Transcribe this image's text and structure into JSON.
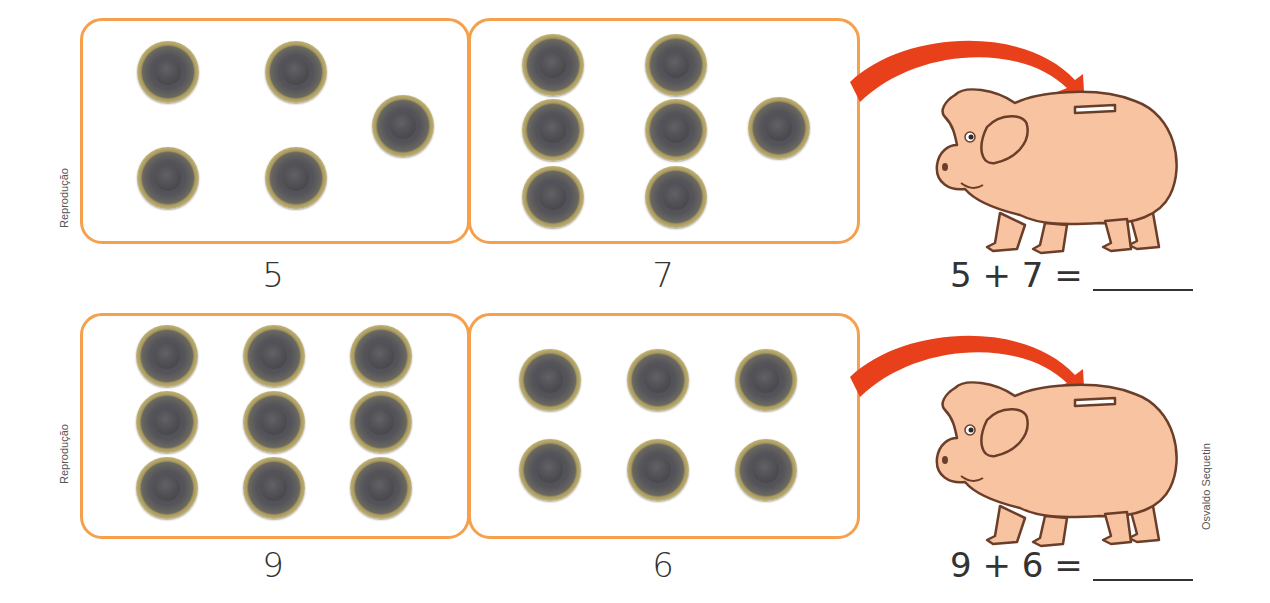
{
  "exercises": [
    {
      "left_count": 5,
      "right_count": 7,
      "left_label": "5",
      "right_label": "7",
      "equation": "5 + 7 =",
      "credit": "Reprodução",
      "left_coins": [
        [
          168,
          72
        ],
        [
          296,
          72
        ],
        [
          403,
          126
        ],
        [
          168,
          178
        ],
        [
          296,
          178
        ]
      ],
      "right_coins": [
        [
          553,
          65
        ],
        [
          676,
          65
        ],
        [
          779,
          128
        ],
        [
          553,
          130
        ],
        [
          676,
          130
        ],
        [
          553,
          197
        ],
        [
          676,
          197
        ]
      ]
    },
    {
      "left_count": 9,
      "right_count": 6,
      "left_label": "9",
      "right_label": "6",
      "equation": "9 + 6 =",
      "credit": "Reprodução",
      "left_coins": [
        [
          167,
          356
        ],
        [
          274,
          356
        ],
        [
          381,
          356
        ],
        [
          167,
          422
        ],
        [
          274,
          422
        ],
        [
          381,
          422
        ],
        [
          167,
          488
        ],
        [
          274,
          488
        ],
        [
          381,
          488
        ]
      ],
      "right_coins": [
        [
          550,
          380
        ],
        [
          658,
          380
        ],
        [
          766,
          380
        ],
        [
          550,
          470
        ],
        [
          658,
          470
        ],
        [
          766,
          470
        ]
      ]
    }
  ],
  "illustrator_credit": "Osvaldo Sequetin",
  "colors": {
    "box_border": "#f6a04d",
    "arrow": "#e8401a",
    "pig_fill": "#f7c3a0",
    "pig_outline": "#6b3e2a",
    "coin_ring": "#c4b47a",
    "coin_center": "#4a4a4e",
    "text": "#333333"
  }
}
